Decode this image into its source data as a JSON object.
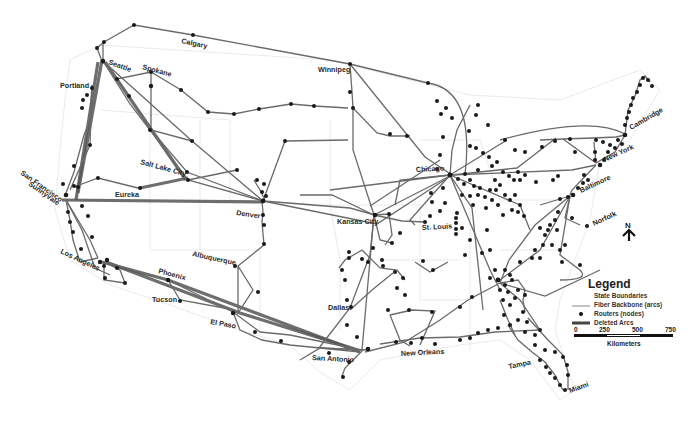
{
  "map": {
    "title": "Fiber backbone network map (US)",
    "colors": {
      "background": "#ffffff",
      "arc": "#6a6a6a",
      "deleted_arc": "#555555",
      "node": "#1a1a1a",
      "state_boundary": "#e4e4e4"
    },
    "cities": [
      {
        "name": "Calgary",
        "x": 181,
        "y": 43,
        "rotate": 12
      },
      {
        "name": "Seattle",
        "x": 108,
        "y": 64,
        "rotate": 20
      },
      {
        "name": "Spokane",
        "x": 142,
        "y": 69,
        "rotate": 15
      },
      {
        "name": "Winnipeg",
        "x": 318,
        "y": 72,
        "rotate": 0
      },
      {
        "name": "Portland",
        "x": 60,
        "y": 88,
        "rotate": 0
      },
      {
        "name": "Salt Lake City",
        "x": 140,
        "y": 164,
        "rotate": 15
      },
      {
        "name": "Chicago",
        "x": 416,
        "y": 172,
        "rotate": -3
      },
      {
        "name": "Cambridge",
        "x": 631,
        "y": 130,
        "rotate": -30
      },
      {
        "name": "New York",
        "x": 605,
        "y": 162,
        "rotate": -25
      },
      {
        "name": "Baltimore",
        "x": 581,
        "y": 193,
        "rotate": -25
      },
      {
        "name": "Eureka",
        "x": 115,
        "y": 197,
        "rotate": 0
      },
      {
        "name": "San Francisco",
        "x": 20,
        "y": 174,
        "rotate": 35
      },
      {
        "name": "Sunnyvale",
        "x": 28,
        "y": 185,
        "rotate": 35
      },
      {
        "name": "Denver",
        "x": 236,
        "y": 215,
        "rotate": 8
      },
      {
        "name": "Kansas City",
        "x": 337,
        "y": 224,
        "rotate": 0
      },
      {
        "name": "St. Louis",
        "x": 422,
        "y": 230,
        "rotate": -3
      },
      {
        "name": "Norfolk",
        "x": 594,
        "y": 226,
        "rotate": -25
      },
      {
        "name": "Albuquerque",
        "x": 192,
        "y": 256,
        "rotate": 12
      },
      {
        "name": "Los Angeles",
        "x": 60,
        "y": 253,
        "rotate": 25
      },
      {
        "name": "Phoenix",
        "x": 158,
        "y": 273,
        "rotate": 15
      },
      {
        "name": "Tucson",
        "x": 152,
        "y": 302,
        "rotate": 0
      },
      {
        "name": "El Paso",
        "x": 210,
        "y": 324,
        "rotate": 10
      },
      {
        "name": "Dallas",
        "x": 328,
        "y": 310,
        "rotate": 0
      },
      {
        "name": "San Antonio",
        "x": 312,
        "y": 360,
        "rotate": 3
      },
      {
        "name": "New Orleans",
        "x": 401,
        "y": 356,
        "rotate": -3
      },
      {
        "name": "Tampa",
        "x": 509,
        "y": 369,
        "rotate": -12
      },
      {
        "name": "Miami",
        "x": 570,
        "y": 393,
        "rotate": -20
      }
    ]
  },
  "legend": {
    "title": "Legend",
    "items": [
      {
        "symbol": "state-boundary",
        "label": "State Boundaries"
      },
      {
        "symbol": "fiber-arc",
        "label": "Fiber Backbone (arcs)"
      },
      {
        "symbol": "router-node",
        "label": "Routers (nodes)"
      },
      {
        "symbol": "deleted-arc",
        "label": "Deleted Arcs"
      }
    ],
    "scale": {
      "ticks": [
        "0",
        "250",
        "500",
        "750"
      ],
      "unit": "Kilometers"
    }
  },
  "north_arrow": {
    "label": "N"
  }
}
